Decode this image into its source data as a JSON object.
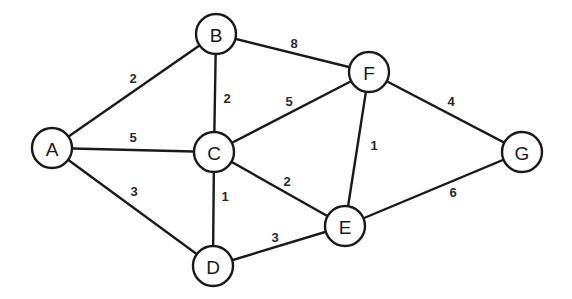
{
  "diagram": {
    "type": "weighted-undirected-graph",
    "colors": {
      "stroke": "#1a1a1a",
      "node_fill": "#ffffff",
      "background": "#ffffff"
    },
    "node_radius": 20,
    "nodes": [
      {
        "id": "A",
        "label": "A",
        "x": 52,
        "y": 148
      },
      {
        "id": "B",
        "label": "B",
        "x": 216,
        "y": 34
      },
      {
        "id": "C",
        "label": "C",
        "x": 214,
        "y": 152
      },
      {
        "id": "D",
        "label": "D",
        "x": 213,
        "y": 266
      },
      {
        "id": "E",
        "label": "E",
        "x": 345,
        "y": 226
      },
      {
        "id": "F",
        "label": "F",
        "x": 369,
        "y": 72
      },
      {
        "id": "G",
        "label": "G",
        "x": 522,
        "y": 152
      }
    ],
    "edges": [
      {
        "from": "A",
        "to": "B",
        "weight": "2",
        "label_x": 133,
        "label_y": 78
      },
      {
        "from": "A",
        "to": "C",
        "weight": "5",
        "label_x": 133,
        "label_y": 137
      },
      {
        "from": "A",
        "to": "D",
        "weight": "3",
        "label_x": 134,
        "label_y": 191
      },
      {
        "from": "B",
        "to": "C",
        "weight": "2",
        "label_x": 227,
        "label_y": 98
      },
      {
        "from": "B",
        "to": "F",
        "weight": "8",
        "label_x": 294,
        "label_y": 43
      },
      {
        "from": "C",
        "to": "F",
        "weight": "5",
        "label_x": 289,
        "label_y": 101
      },
      {
        "from": "C",
        "to": "D",
        "weight": "1",
        "label_x": 225,
        "label_y": 196
      },
      {
        "from": "C",
        "to": "E",
        "weight": "2",
        "label_x": 287,
        "label_y": 181
      },
      {
        "from": "D",
        "to": "E",
        "weight": "3",
        "label_x": 275,
        "label_y": 237
      },
      {
        "from": "F",
        "to": "E",
        "weight": "1",
        "label_x": 374,
        "label_y": 145
      },
      {
        "from": "F",
        "to": "G",
        "weight": "4",
        "label_x": 451,
        "label_y": 101
      },
      {
        "from": "E",
        "to": "G",
        "weight": "6",
        "label_x": 453,
        "label_y": 192
      }
    ]
  }
}
